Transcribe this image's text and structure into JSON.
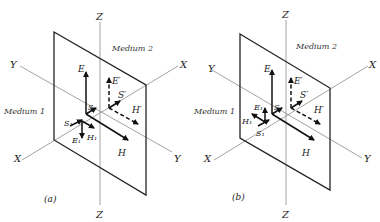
{
  "figure": {
    "panels": [
      {
        "id": "a",
        "caption": "(a)",
        "axes": {
          "z_top": "Z",
          "z_bottom": "Z",
          "x_right": "X",
          "x_left": "X",
          "y_left": "Y",
          "y_right": "Y"
        },
        "media": {
          "medium1": "Medium 1",
          "medium2": "Medium 2"
        },
        "vectors": {
          "E": "E",
          "E_prime": "E′",
          "S_prime": "S′",
          "H_prime": "H′",
          "S": "S",
          "S1": "S₁",
          "E1": "E₁",
          "H1": "H₁",
          "H": "H"
        }
      },
      {
        "id": "b",
        "caption": "(b)",
        "axes": {
          "z_top": "Z",
          "z_bottom": "Z",
          "x_right": "X",
          "x_left": "X",
          "y_left": "Y",
          "y_right": "Y"
        },
        "media": {
          "medium1": "Medium 1",
          "medium2": "Medium 2"
        },
        "vectors": {
          "E": "E",
          "E_prime": "E′",
          "S_prime": "S′",
          "H_prime": "H′",
          "S": "S",
          "E1": "E₁",
          "H1": "H₁",
          "S1": "S₁",
          "H": "H"
        }
      }
    ]
  }
}
